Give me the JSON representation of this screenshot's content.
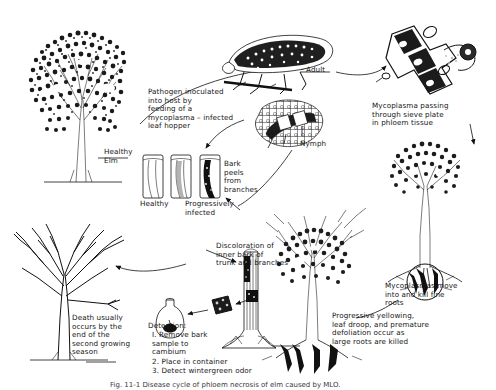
{
  "figure": {
    "caption": "Fig. 11-1  Disease cycle of phloem necrosis of elm caused by MLO."
  },
  "labels": {
    "healthy_elm": "Healthy\nElm",
    "pathogen_inoculation": "Pathogen   inoculated\ninto   host   by\nfeeding   of   a\nmycoplasma – infected\nleaf   hopper",
    "adult": "Adult",
    "nymph": "Nymph",
    "mycoplasma_sieve": "Mycoplasma   passing\nthrough   sieve   plate\nin   phloem   tissue",
    "bark_peels": "Bark\npeels\nfrom\nbranches",
    "bark_healthy": "Healthy",
    "bark_infected": "Progressively\ninfected",
    "discoloration": "Discoloration   of\ninner   bark   of\ntrunk   and   branches",
    "roots_killed": "Mycoplasmas   move\ninto   and   kill   fine\nroots",
    "progressive_yellowing": "Progressive   yellowing,\nleaf   droop,   and   premature\ndefoliation   occur   as\nlarge   roots   are   killed",
    "death": "Death   usually\noccurs   by   the\nend   of   the\nsecond   growing\nseason",
    "detection_title": "Detection:",
    "detection_steps": [
      "I.  Remove    bark\n      sample    to\n      cambium",
      "2.  Place   in   container",
      "3.  Detect   wintergreen   odor"
    ]
  },
  "colors": {
    "ink": "#111111",
    "paper": "#ffffff",
    "shade": "#d8d8d8"
  }
}
